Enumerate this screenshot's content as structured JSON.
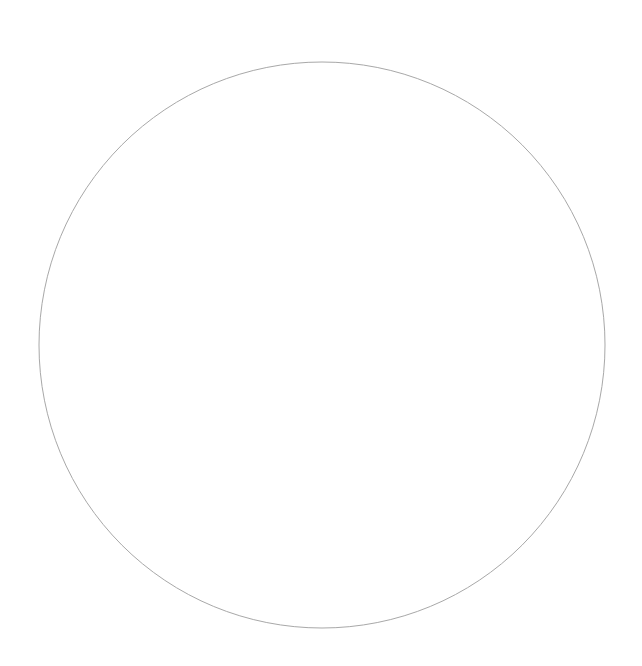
{
  "canvas": {
    "width": 642,
    "height": 666,
    "background": "#ffffff"
  },
  "shapes": [
    {
      "type": "circle",
      "cx": 322,
      "cy": 345,
      "r": 283,
      "stroke": "#a8a8a8",
      "stroke_width": 1,
      "fill": "none"
    }
  ]
}
